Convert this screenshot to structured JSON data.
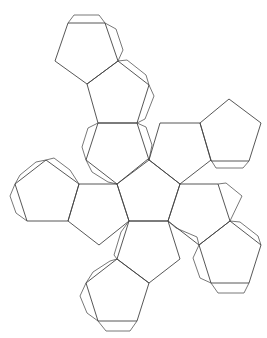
{
  "diagram": {
    "title": "",
    "type": "polyhedron-net",
    "line_color": "#444444",
    "background": "#ffffff",
    "faces": [
      {
        "id": "center",
        "points": "148,159 180,184 168,221 129,221 117,184"
      },
      {
        "id": "upper-left-1",
        "points": "98,123 137,123 149,160 117,184 86,160"
      },
      {
        "id": "upper-left-2",
        "points": "118,61 149,85 137,123 98,123 87,84"
      },
      {
        "id": "top",
        "points": "68,23 105,23 118,61 87,84 55,61"
      },
      {
        "id": "upper-right-1",
        "points": "160,123 200,123 211,160 180,184 149,160"
      },
      {
        "id": "far-right",
        "points": "229,99 261,123 249,161 211,161 200,123"
      },
      {
        "id": "left-1",
        "points": "79,184 117,184 129,221 99,245 68,221"
      },
      {
        "id": "far-left",
        "points": "46,160 79,184 68,221 27,221 15,184"
      },
      {
        "id": "right-1",
        "points": "180,184 218,184 230,221 199,245 168,221"
      },
      {
        "id": "lower-right",
        "points": "230,221 261,245 249,283 211,283 199,245"
      },
      {
        "id": "bottom-1",
        "points": "129,221 168,221 180,259 149,283 117,259"
      },
      {
        "id": "bottom-2",
        "points": "117,259 149,283 137,321 98,321 86,283"
      }
    ],
    "tabs": [
      {
        "id": "tab-top",
        "points": "68,23 74,15 99,15 105,23"
      },
      {
        "id": "tab-top-right",
        "points": "105,23 116,29 123,50 118,61"
      },
      {
        "id": "tab-ul2-right",
        "points": "118,61 127,60 146,75 149,85"
      },
      {
        "id": "tab-ul2-right-lower",
        "points": "149,85 154,96 145,119 137,123"
      },
      {
        "id": "tab-ul1-left",
        "points": "98,123 88,128 82,147 86,160"
      },
      {
        "id": "tab-ul1-right",
        "points": "137,123 146,127 152,145 149,160"
      },
      {
        "id": "tab-ul1-bottom",
        "points": "86,160 92,172 108,182 117,184"
      },
      {
        "id": "tab-far-right-bottom",
        "points": "211,160 216,168 243,168 249,161"
      },
      {
        "id": "tab-far-left-top",
        "points": "46,160 36,162 20,175 15,184"
      },
      {
        "id": "tab-far-left-left",
        "points": "15,184 10,196 16,213 27,221"
      },
      {
        "id": "tab-far-left-top2",
        "points": "46,160 54,158 70,170 79,184"
      },
      {
        "id": "tab-center-bl",
        "points": "129,221 121,232 114,255 117,259"
      },
      {
        "id": "tab-center-br",
        "points": "168,221 176,228 197,237 199,245"
      },
      {
        "id": "tab-right-top",
        "points": "218,184 226,183 242,196 230,221"
      },
      {
        "id": "tab-lower-right-tr",
        "points": "230,221 240,222 258,236 261,245"
      },
      {
        "id": "tab-lower-right-left",
        "points": "199,245 193,258 200,278 211,283"
      },
      {
        "id": "tab-lower-right-bottom",
        "points": "211,283 218,293 244,293 249,283"
      },
      {
        "id": "tab-bottom2-tl",
        "points": "117,259 110,261 93,272 86,283"
      },
      {
        "id": "tab-bottom2-left",
        "points": "86,283 80,296 87,313 98,321"
      },
      {
        "id": "tab-bottom2-bottom",
        "points": "98,321 106,331 130,331 137,321"
      }
    ]
  }
}
